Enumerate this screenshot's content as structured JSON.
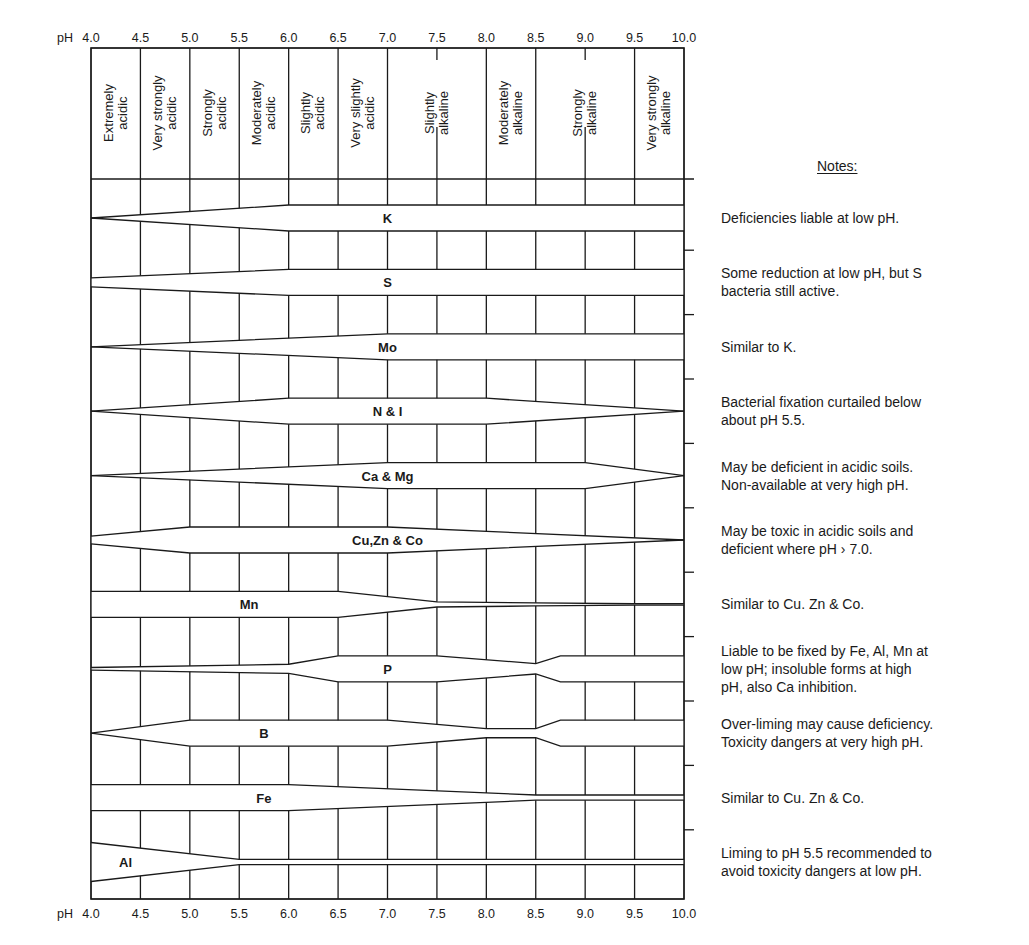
{
  "chart_data": {
    "type": "table",
    "xlabel": "pH",
    "xlim": [
      4.0,
      10.0
    ],
    "ph_ticks": [
      "4.0",
      "4.5",
      "5.0",
      "5.5",
      "6.0",
      "6.5",
      "7.0",
      "7.5",
      "8.0",
      "8.5",
      "9.0",
      "9.5",
      "10.0"
    ],
    "axis_prefix": "pH",
    "ph_classes": [
      {
        "label": [
          "Extremely",
          "acidic"
        ],
        "from": 4.0,
        "to": 4.5
      },
      {
        "label": [
          "Very strongly",
          "acidic"
        ],
        "from": 4.5,
        "to": 5.0
      },
      {
        "label": [
          "Strongly",
          "acidic"
        ],
        "from": 5.0,
        "to": 5.5
      },
      {
        "label": [
          "Moderately",
          "acidic"
        ],
        "from": 5.5,
        "to": 6.0
      },
      {
        "label": [
          "Slightly",
          "acidic"
        ],
        "from": 6.0,
        "to": 6.5
      },
      {
        "label": [
          "Very slightly",
          "acidic"
        ],
        "from": 6.5,
        "to": 7.0
      },
      {
        "label": [
          "Slightly",
          "alkaline"
        ],
        "from": 7.0,
        "to": 8.0
      },
      {
        "label": [
          "Moderately",
          "alkaline"
        ],
        "from": 8.0,
        "to": 8.5
      },
      {
        "label": [
          "Strongly",
          "alkaline"
        ],
        "from": 8.5,
        "to": 9.5
      },
      {
        "label": [
          "Very strongly",
          "alkaline"
        ],
        "from": 9.5,
        "to": 10.0
      }
    ],
    "header_full_dividers": [
      4.5,
      5.0,
      5.5,
      6.0,
      6.5,
      7.0,
      8.0,
      8.5,
      9.5
    ],
    "header_partial_dividers": [
      7.5,
      9.0
    ],
    "availability_scale": "relative band width (1.0 = full availability, 0 = none)",
    "series": [
      {
        "name": "K",
        "label_ph": 7.0,
        "profile": [
          [
            4.0,
            0.0
          ],
          [
            6.0,
            1.0
          ],
          [
            10.0,
            1.0
          ]
        ]
      },
      {
        "name": "S",
        "label_ph": 7.0,
        "profile": [
          [
            4.0,
            0.35
          ],
          [
            6.0,
            1.0
          ],
          [
            10.0,
            1.0
          ]
        ]
      },
      {
        "name": "Mo",
        "label_ph": 7.0,
        "profile": [
          [
            4.0,
            0.0
          ],
          [
            7.0,
            1.0
          ],
          [
            10.0,
            1.0
          ]
        ]
      },
      {
        "name": "N & I",
        "label_ph": 7.0,
        "profile": [
          [
            4.0,
            0.0
          ],
          [
            6.0,
            1.0
          ],
          [
            8.0,
            1.0
          ],
          [
            10.0,
            0.0
          ]
        ]
      },
      {
        "name": "Ca & Mg",
        "label_ph": 7.0,
        "profile": [
          [
            4.0,
            0.0
          ],
          [
            7.0,
            1.0
          ],
          [
            9.0,
            1.0
          ],
          [
            10.0,
            0.0
          ]
        ]
      },
      {
        "name": "Cu,Zn & Co",
        "label_ph": 7.0,
        "profile": [
          [
            4.0,
            0.3
          ],
          [
            5.0,
            1.0
          ],
          [
            7.0,
            1.0
          ],
          [
            10.0,
            0.0
          ]
        ]
      },
      {
        "name": "Mn",
        "label_ph": 5.6,
        "profile": [
          [
            4.0,
            1.0
          ],
          [
            6.5,
            1.0
          ],
          [
            7.5,
            0.2
          ],
          [
            8.5,
            0.12
          ],
          [
            9.5,
            0.05
          ],
          [
            10.0,
            0.05
          ]
        ]
      },
      {
        "name": "P",
        "label_ph": 7.0,
        "profile": [
          [
            4.0,
            0.1
          ],
          [
            6.0,
            0.35
          ],
          [
            6.5,
            1.0
          ],
          [
            7.5,
            1.0
          ],
          [
            8.5,
            0.4
          ],
          [
            8.75,
            1.0
          ],
          [
            10.0,
            1.0
          ]
        ]
      },
      {
        "name": "B",
        "label_ph": 5.75,
        "profile": [
          [
            4.0,
            0.0
          ],
          [
            5.0,
            1.0
          ],
          [
            7.0,
            1.0
          ],
          [
            8.0,
            0.35
          ],
          [
            8.5,
            0.35
          ],
          [
            8.75,
            1.0
          ],
          [
            10.0,
            1.0
          ]
        ]
      },
      {
        "name": "Fe",
        "label_ph": 5.75,
        "profile": [
          [
            4.0,
            1.0
          ],
          [
            6.0,
            1.0
          ],
          [
            8.5,
            0.2
          ],
          [
            10.0,
            0.2
          ]
        ]
      },
      {
        "name": "Al",
        "label_ph": 4.35,
        "profile": [
          [
            4.0,
            1.5
          ],
          [
            5.5,
            0.2
          ],
          [
            10.0,
            0.2
          ]
        ]
      }
    ]
  },
  "notes": {
    "title": "Notes:",
    "items": [
      [
        "Deficiencies liable at low pH."
      ],
      [
        "Some reduction at low pH, but S",
        "bacteria still active."
      ],
      [
        "Similar to K."
      ],
      [
        "Bacterial fixation curtailed below",
        "about  pH 5.5."
      ],
      [
        "May be deficient in acidic soils.",
        "Non-available at very high pH."
      ],
      [
        "May be toxic in acidic soils and",
        "deficient where pH › 7.0."
      ],
      [
        "Similar to Cu. Zn & Co."
      ],
      [
        "Liable to be fixed by Fe, Al, Mn at",
        "low pH;  insoluble forms at high",
        "pH, also Ca inhibition."
      ],
      [
        "Over-liming may cause deficiency.",
        "Toxicity dangers at very high pH."
      ],
      [
        "Similar to Cu. Zn & Co."
      ],
      [
        "Liming to pH 5.5 recommended to",
        "avoid toxicity dangers at low pH."
      ]
    ]
  },
  "colors": {
    "ink": "#1a1a1a",
    "paper": "#ffffff"
  }
}
